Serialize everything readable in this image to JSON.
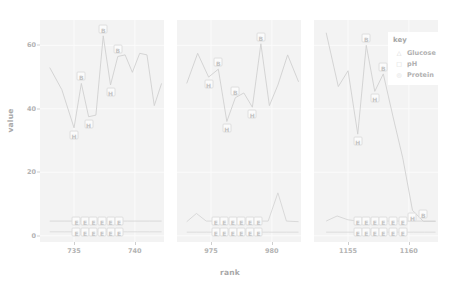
{
  "chart_data": {
    "type": "line",
    "title": "",
    "xlabel": "rank",
    "ylabel": "value",
    "ylim": [
      -2,
      68
    ],
    "yticks": [
      0,
      20,
      40,
      60
    ],
    "grid": true,
    "legend": {
      "title": "key",
      "position": "top-right",
      "entries": [
        {
          "label": "Glucose",
          "symbol": "△",
          "color": "#cfcfcf"
        },
        {
          "label": "pH",
          "symbol": "□",
          "color": "#d4d4d4"
        },
        {
          "label": "Protein",
          "symbol": "◎",
          "color": "#d8d8d8"
        }
      ]
    },
    "panels": [
      {
        "name": "panel-1",
        "xlim": [
          732.2,
          742.4
        ],
        "xticks": [
          735,
          740
        ],
        "series": [
          {
            "name": "Glucose",
            "x": [
              733.0,
              734.0,
              735.0,
              735.6,
              736.2,
              736.8,
              737.4,
              738.0,
              738.6,
              739.2,
              739.8,
              740.4,
              741.0,
              741.6,
              742.2
            ],
            "y": [
              53.0,
              46.0,
              34.0,
              48.0,
              37.5,
              38.0,
              63.0,
              47.5,
              56.5,
              57.0,
              51.5,
              57.5,
              57.0,
              41.0,
              48.0
            ],
            "labels": [
              null,
              null,
              "H",
              "B",
              "H",
              null,
              "B",
              "H",
              "B",
              null,
              null,
              null,
              null,
              null,
              null
            ]
          },
          {
            "name": "pH",
            "x": [
              733.0,
              734.2,
              735.2,
              735.9,
              736.6,
              737.3,
              738.0,
              738.7,
              739.4,
              740.2,
              741.2,
              742.2
            ],
            "y": [
              4.6,
              4.6,
              4.6,
              4.6,
              4.6,
              4.6,
              4.6,
              4.6,
              4.6,
              4.6,
              4.6,
              4.6
            ],
            "labels": [
              null,
              null,
              "E",
              "E",
              "E",
              "E",
              "E",
              "E",
              null,
              null,
              null,
              null
            ]
          },
          {
            "name": "Protein",
            "x": [
              733.0,
              734.2,
              735.2,
              735.9,
              736.6,
              737.3,
              738.0,
              738.7,
              739.4,
              740.2,
              741.2,
              742.2
            ],
            "y": [
              1.2,
              1.2,
              1.2,
              1.2,
              1.2,
              1.2,
              1.2,
              1.2,
              1.2,
              1.2,
              1.2,
              1.2
            ],
            "labels": [
              null,
              null,
              "E",
              "E",
              "E",
              "E",
              "E",
              "E",
              null,
              null,
              null,
              null
            ]
          }
        ]
      },
      {
        "name": "panel-2",
        "xlim": [
          972.2,
          982.4
        ],
        "xticks": [
          975,
          980
        ],
        "series": [
          {
            "name": "Glucose",
            "x": [
              973.0,
              973.9,
              974.8,
              975.6,
              976.3,
              977.0,
              977.7,
              978.4,
              979.1,
              979.8,
              980.5,
              981.3,
              982.2
            ],
            "y": [
              48.0,
              57.5,
              50.0,
              52.5,
              36.0,
              43.5,
              45.0,
              40.5,
              60.5,
              41.0,
              47.5,
              57.0,
              48.5
            ],
            "labels": [
              null,
              null,
              "H",
              "B",
              "H",
              "B",
              null,
              "H",
              "B",
              null,
              null,
              null,
              null
            ]
          },
          {
            "name": "pH",
            "x": [
              973.0,
              973.8,
              974.6,
              975.4,
              976.1,
              976.8,
              977.5,
              978.2,
              978.9,
              979.7,
              980.5,
              981.2,
              982.2
            ],
            "y": [
              4.4,
              7.0,
              4.6,
              4.6,
              4.6,
              4.6,
              4.6,
              4.6,
              4.6,
              4.6,
              13.5,
              4.6,
              4.4
            ],
            "labels": [
              null,
              null,
              null,
              "E",
              "E",
              "E",
              "E",
              "E",
              "E",
              null,
              null,
              null,
              null
            ]
          },
          {
            "name": "Protein",
            "x": [
              973.0,
              973.8,
              974.6,
              975.4,
              976.1,
              976.8,
              977.5,
              978.2,
              978.9,
              979.7,
              980.5,
              981.2,
              982.2
            ],
            "y": [
              1.1,
              1.1,
              1.1,
              1.1,
              1.1,
              1.1,
              1.1,
              1.1,
              1.1,
              1.1,
              1.1,
              1.1,
              1.1
            ],
            "labels": [
              null,
              null,
              null,
              "E",
              "E",
              "E",
              "E",
              "E",
              "E",
              null,
              null,
              null,
              null
            ]
          }
        ]
      },
      {
        "name": "panel-3",
        "xlim": [
          1152.2,
          1162.4
        ],
        "xticks": [
          1155,
          1160
        ],
        "series": [
          {
            "name": "Glucose",
            "x": [
              1153.2,
              1154.2,
              1155.0,
              1155.8,
              1156.5,
              1157.2,
              1157.9,
              1158.7,
              1159.5,
              1160.3,
              1161.2,
              1162.2
            ],
            "y": [
              64.0,
              47.0,
              52.0,
              32.0,
              60.0,
              45.5,
              51.0,
              37.5,
              24.5,
              8.0,
              4.5,
              4.5
            ],
            "labels": [
              null,
              null,
              null,
              "H",
              "B",
              "H",
              "B",
              null,
              null,
              "H",
              "B",
              null
            ]
          },
          {
            "name": "pH",
            "x": [
              1153.2,
              1154.1,
              1155.0,
              1155.8,
              1156.5,
              1157.2,
              1157.9,
              1158.7,
              1159.5,
              1160.4,
              1161.3,
              1162.2
            ],
            "y": [
              4.6,
              6.2,
              5.0,
              4.6,
              4.6,
              4.6,
              4.6,
              4.6,
              4.6,
              4.6,
              4.6,
              4.6
            ],
            "labels": [
              null,
              null,
              null,
              "E",
              "E",
              "E",
              "E",
              "E",
              "E",
              null,
              null,
              null
            ]
          },
          {
            "name": "Protein",
            "x": [
              1153.2,
              1154.1,
              1155.0,
              1155.8,
              1156.5,
              1157.2,
              1157.9,
              1158.7,
              1159.5,
              1160.4,
              1161.3,
              1162.2
            ],
            "y": [
              1.1,
              1.1,
              1.1,
              1.1,
              1.1,
              1.1,
              1.1,
              1.1,
              1.1,
              1.1,
              1.1,
              1.1
            ],
            "labels": [
              null,
              null,
              null,
              "E",
              "E",
              "E",
              "E",
              "E",
              "E",
              null,
              null,
              null
            ]
          }
        ]
      }
    ]
  }
}
